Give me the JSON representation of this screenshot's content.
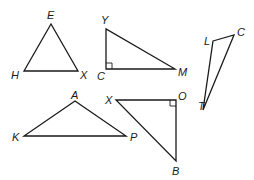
{
  "figure": {
    "triangles": [
      {
        "id": "EHX",
        "vertices": [
          {
            "label": "E",
            "x": 51,
            "y": 24,
            "lx": 47,
            "ly": 19
          },
          {
            "label": "H",
            "x": 24,
            "y": 71,
            "lx": 11,
            "ly": 79
          },
          {
            "label": "X",
            "x": 78,
            "y": 71,
            "lx": 80,
            "ly": 79
          }
        ],
        "right_angle": null
      },
      {
        "id": "YCM",
        "vertices": [
          {
            "label": "Y",
            "x": 106,
            "y": 29,
            "lx": 101,
            "ly": 24
          },
          {
            "label": "C",
            "x": 106,
            "y": 69,
            "lx": 97,
            "ly": 80
          },
          {
            "label": "M",
            "x": 175,
            "y": 69,
            "lx": 178,
            "ly": 76
          }
        ],
        "right_angle": {
          "at": "C",
          "x": 106,
          "y": 69,
          "dx": 1,
          "dy": -1
        }
      },
      {
        "id": "LCT",
        "vertices": [
          {
            "label": "L",
            "x": 213,
            "y": 41,
            "lx": 204,
            "ly": 45
          },
          {
            "label": "C",
            "x": 234,
            "y": 35,
            "lx": 237,
            "ly": 36
          },
          {
            "label": "T",
            "x": 203,
            "y": 110,
            "lx": 198,
            "ly": 110
          }
        ],
        "right_angle": null
      },
      {
        "id": "AKP",
        "vertices": [
          {
            "label": "A",
            "x": 75,
            "y": 101,
            "lx": 71,
            "ly": 99
          },
          {
            "label": "K",
            "x": 24,
            "y": 136,
            "lx": 12,
            "ly": 141
          },
          {
            "label": "P",
            "x": 126,
            "y": 136,
            "lx": 130,
            "ly": 141
          }
        ],
        "right_angle": null
      },
      {
        "id": "XOB",
        "vertices": [
          {
            "label": "X",
            "x": 116,
            "y": 100,
            "lx": 105,
            "ly": 104
          },
          {
            "label": "O",
            "x": 176,
            "y": 100,
            "lx": 178,
            "ly": 100
          },
          {
            "label": "B",
            "x": 176,
            "y": 161,
            "lx": 172,
            "ly": 175
          }
        ],
        "right_angle": {
          "at": "O",
          "x": 176,
          "y": 100,
          "dx": -1,
          "dy": 1
        }
      }
    ]
  }
}
